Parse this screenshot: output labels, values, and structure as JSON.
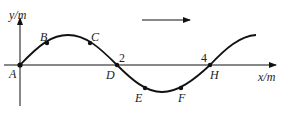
{
  "diagram": {
    "type": "transverse-wave",
    "axes": {
      "y_label": "y/m",
      "x_label": "x/m",
      "ticks": [
        {
          "value": "2",
          "point": "D"
        },
        {
          "value": "4",
          "point": "H"
        }
      ]
    },
    "direction_arrow": "right",
    "points": [
      {
        "name": "A",
        "desc": "origin, equilibrium"
      },
      {
        "name": "B",
        "desc": "rising, before crest"
      },
      {
        "name": "C",
        "desc": "falling, after crest"
      },
      {
        "name": "D",
        "desc": "equilibrium at x=2"
      },
      {
        "name": "E",
        "desc": "before trough"
      },
      {
        "name": "F",
        "desc": "after trough"
      },
      {
        "name": "H",
        "desc": "equilibrium at x=4"
      }
    ],
    "colors": {
      "line": "#111111",
      "background": "#ffffff"
    }
  }
}
